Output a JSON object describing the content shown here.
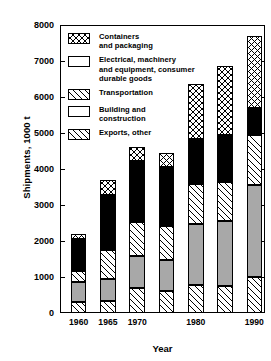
{
  "chart_data": {
    "type": "bar",
    "subtype": "stacked-bar",
    "title": "",
    "xlabel": "Year",
    "ylabel": "Shipments, 1000 t",
    "ylim": [
      0,
      8000
    ],
    "yticks": [
      0,
      1000,
      2000,
      3000,
      4000,
      5000,
      6000,
      7000,
      8000
    ],
    "grid": false,
    "legend_position": "upper-left-inside",
    "categories": [
      "1960",
      "1965",
      "1970",
      "1975",
      "1980",
      "1985",
      "1990"
    ],
    "xtick_labels": [
      "1960",
      "1965",
      "1970",
      "1980",
      "1990"
    ],
    "series": [
      {
        "name": "Exports, other",
        "pattern": "diagonal-hatch",
        "values": [
          300,
          330,
          700,
          620,
          780,
          750,
          1000
        ]
      },
      {
        "name": "Building and construction",
        "pattern": "solid-gray",
        "color": "#a8a8a8",
        "values": [
          560,
          620,
          880,
          840,
          1700,
          1800,
          2550
        ]
      },
      {
        "name": "Transportation",
        "pattern": "diagonal-hatch",
        "values": [
          300,
          800,
          940,
          960,
          1100,
          1100,
          1400
        ]
      },
      {
        "name": "Electrical, machinery and equipment, consumer durable goods",
        "pattern": "solid-black",
        "color": "#000000",
        "values": [
          900,
          1530,
          1700,
          1630,
          1250,
          1300,
          750
        ]
      },
      {
        "name": "Containers and packaging",
        "pattern": "cross-hatch",
        "values": [
          140,
          420,
          380,
          400,
          1520,
          1900,
          2000
        ]
      }
    ],
    "totals": [
      2200,
      3700,
      4600,
      4450,
      6350,
      6850,
      7700
    ]
  },
  "legend": {
    "items": [
      {
        "label_line1": "Containers",
        "label_line2": "and packaging",
        "label_line3": "",
        "swatch": "cross-hatch"
      },
      {
        "label_line1": "Electrical, machinery",
        "label_line2": "and equipment, consumer",
        "label_line3": "durable goods",
        "swatch": "solid-black"
      },
      {
        "label_line1": "Transportation",
        "label_line2": "",
        "label_line3": "",
        "swatch": "diagonal-hatch"
      },
      {
        "label_line1": "Building and",
        "label_line2": "construction",
        "label_line3": "",
        "swatch": "solid-gray"
      },
      {
        "label_line1": "Exports, other",
        "label_line2": "",
        "label_line3": "",
        "swatch": "diagonal-hatch"
      }
    ]
  }
}
